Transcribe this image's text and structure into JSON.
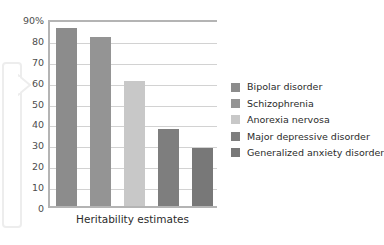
{
  "chart_data": {
    "type": "bar",
    "title": "",
    "subtitle": "",
    "xlabel": "Heritability estimates",
    "ylabel": "",
    "categories": [
      "Bipolar disorder",
      "Schizophrenia",
      "Anorexia nervosa",
      "Major depressive disorder",
      "Generalized anxiety disorder"
    ],
    "values": [
      85,
      81,
      60,
      37,
      28
    ],
    "ylim": [
      0,
      90
    ],
    "y_tick_values": [
      0,
      10,
      20,
      30,
      40,
      50,
      60,
      70,
      80,
      90
    ],
    "y_tick_labels": [
      "0",
      "10",
      "20",
      "30",
      "40",
      "50",
      "60",
      "70",
      "80",
      "90%"
    ],
    "grid": true,
    "legend_position": "right",
    "series": [
      {
        "name": "Heritability estimates",
        "values": [
          85,
          81,
          60,
          37,
          28
        ]
      }
    ],
    "bar_colors": [
      "#8c8c8c",
      "#949494",
      "#c8c8c8",
      "#7e7e7e",
      "#787878"
    ],
    "legend": [
      {
        "label": "Bipolar disorder",
        "color": "#8c8c8c"
      },
      {
        "label": "Schizophrenia",
        "color": "#949494"
      },
      {
        "label": "Anorexia nervosa",
        "color": "#c8c8c8"
      },
      {
        "label": "Major depressive disorder",
        "color": "#7e7e7e"
      },
      {
        "label": "Generalized anxiety disorder",
        "color": "#787878"
      }
    ],
    "axis_color": "#b4b4b4",
    "grid_color": "#d2d2d2",
    "text_color": "#2b2b2b",
    "background": "#ffffff"
  }
}
